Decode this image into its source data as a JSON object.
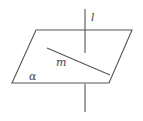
{
  "diagram": {
    "labels": {
      "line_l": "l",
      "line_m": "m",
      "plane": "α"
    },
    "stroke_color": "#555555",
    "plane": {
      "points": [
        [
          36,
          30
        ],
        [
          132,
          30
        ],
        [
          109,
          83
        ],
        [
          12,
          83
        ]
      ]
    },
    "line_l": {
      "x": 85,
      "upper": [
        9,
        53
      ],
      "lower": [
        84,
        112
      ]
    },
    "line_m": {
      "from": [
        47,
        48
      ],
      "to": [
        110,
        75
      ]
    }
  }
}
